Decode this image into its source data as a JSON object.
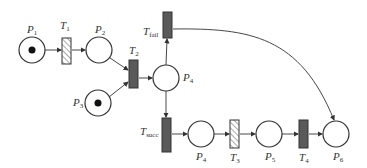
{
  "diagram": {
    "type": "petri-net",
    "places": [
      {
        "id": "P1",
        "label": "P",
        "sub": "1",
        "token": true
      },
      {
        "id": "P2",
        "label": "P",
        "sub": "2",
        "token": false
      },
      {
        "id": "P3",
        "label": "P",
        "sub": "3",
        "token": true
      },
      {
        "id": "P4a",
        "label": "P",
        "sub": "4",
        "token": false
      },
      {
        "id": "P4b",
        "label": "P",
        "sub": "4",
        "token": false
      },
      {
        "id": "P5",
        "label": "P",
        "sub": "5",
        "token": false
      },
      {
        "id": "P6",
        "label": "P",
        "sub": "6",
        "token": false
      }
    ],
    "transitions": [
      {
        "id": "T1",
        "label": "T",
        "sub": "1",
        "style": "hatched"
      },
      {
        "id": "T2",
        "label": "T",
        "sub": "2",
        "style": "solid"
      },
      {
        "id": "Tfail",
        "label": "T",
        "sub": "fail",
        "style": "solid"
      },
      {
        "id": "Tsucc",
        "label": "T",
        "sub": "succ",
        "style": "solid"
      },
      {
        "id": "T3",
        "label": "T",
        "sub": "3",
        "style": "hatched"
      },
      {
        "id": "T4",
        "label": "T",
        "sub": "4",
        "style": "solid"
      }
    ],
    "arcs": [
      [
        "P1",
        "T1"
      ],
      [
        "T1",
        "P2"
      ],
      [
        "P2",
        "T2"
      ],
      [
        "P3",
        "T2"
      ],
      [
        "T2",
        "P4a"
      ],
      [
        "P4a",
        "Tfail"
      ],
      [
        "P4a",
        "Tsucc"
      ],
      [
        "Tsucc",
        "P4b"
      ],
      [
        "P4b",
        "T3"
      ],
      [
        "T3",
        "P5"
      ],
      [
        "P5",
        "T4"
      ],
      [
        "T4",
        "P6"
      ],
      [
        "Tfail",
        "P6"
      ]
    ],
    "colors": {
      "stroke": "#333333",
      "fill_solid": "#5a5a5a",
      "token": "#111111"
    }
  }
}
